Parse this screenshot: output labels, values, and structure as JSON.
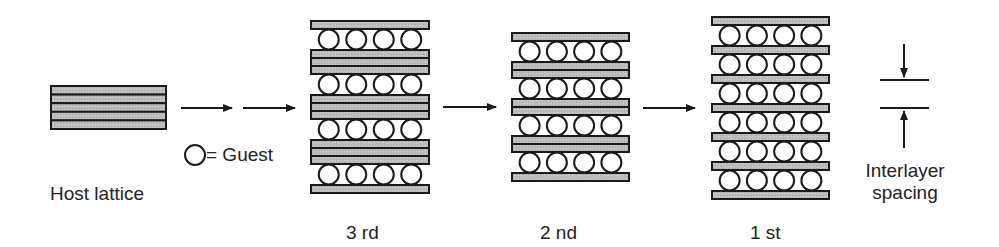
{
  "labels": {
    "host_lattice": "Host lattice",
    "guest_legend": "= Guest",
    "stage3": "3 rd",
    "stage2": "2 nd",
    "stage1": "1 st",
    "interlayer_line1": "Interlayer",
    "interlayer_line2": "spacing"
  },
  "colors": {
    "layer_fill": "#b8b8b8",
    "stroke": "#1a1a1a",
    "background": "#ffffff"
  },
  "structure": {
    "host_lattice_layers": 5,
    "guests_per_row": 4,
    "stages": [
      {
        "name": "3 rd",
        "host_layers_between_galleries": 3,
        "guest_rows": 4
      },
      {
        "name": "2 nd",
        "host_layers_between_galleries": 2,
        "guest_rows": 4
      },
      {
        "name": "1 st",
        "host_layers_between_galleries": 1,
        "guest_rows": 6
      }
    ]
  }
}
